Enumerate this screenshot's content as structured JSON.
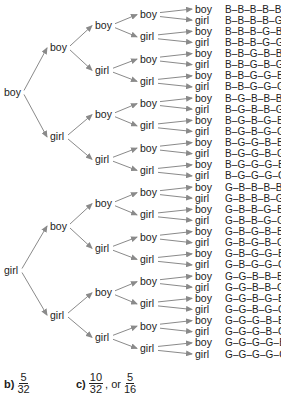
{
  "diagram": {
    "type": "tree",
    "title": "",
    "levels": [
      [
        "boy",
        "girl"
      ],
      [
        "boy",
        "girl",
        "boy",
        "girl"
      ],
      [
        "boy",
        "girl",
        "boy",
        "girl",
        "boy",
        "girl",
        "boy",
        "girl"
      ],
      [
        "boy",
        "girl",
        "boy",
        "girl",
        "boy",
        "girl",
        "boy",
        "girl",
        "boy",
        "girl",
        "boy",
        "girl",
        "boy",
        "girl",
        "boy",
        "girl"
      ],
      [
        "boy",
        "girl",
        "boy",
        "girl",
        "boy",
        "girl",
        "boy",
        "girl",
        "boy",
        "girl",
        "boy",
        "girl",
        "boy",
        "girl",
        "boy",
        "girl",
        "boy",
        "girl",
        "boy",
        "girl",
        "boy",
        "girl",
        "boy",
        "girl",
        "boy",
        "girl",
        "boy",
        "girl",
        "boy",
        "girl",
        "boy",
        "girl"
      ]
    ],
    "outcomes": [
      "B–B–B–B–B",
      "B–B–B–B–G",
      "B–B–B–G–B",
      "B–B–B–G–G",
      "B–B–G–B–B",
      "B–B–G–B–G",
      "B–B–G–G–B",
      "B–B–G–G–G",
      "B–G–B–B–B",
      "B–G–B–B–G",
      "B–G–B–G–B",
      "B–G–B–G–G",
      "B–G–G–B–B",
      "B–G–G–B–G",
      "B–G–G–G–B",
      "B–G–G–G–G",
      "G–B–B–B–B",
      "G–B–B–B–G",
      "G–B–B–G–B",
      "G–B–B–G–G",
      "G–B–G–B–B",
      "G–B–G–B–G",
      "G–B–G–G–B",
      "G–B–G–G–G",
      "G–G–B–B–B",
      "G–G–B–B–G",
      "G–G–B–G–B",
      "G–G–B–G–G",
      "G–G–G–B–B",
      "G–G–G–B–G",
      "G–G–G–G–B",
      "G–G–G–G–G"
    ],
    "arrow_color": "#8a8a8a",
    "text_color": "#222222"
  },
  "answers": {
    "b": {
      "label": "b)",
      "numerator": "5",
      "denominator": "32"
    },
    "c": {
      "label": "c)",
      "numerator": "10",
      "denominator": "32",
      "separator": ", or",
      "alt_numerator": "5",
      "alt_denominator": "16"
    }
  }
}
